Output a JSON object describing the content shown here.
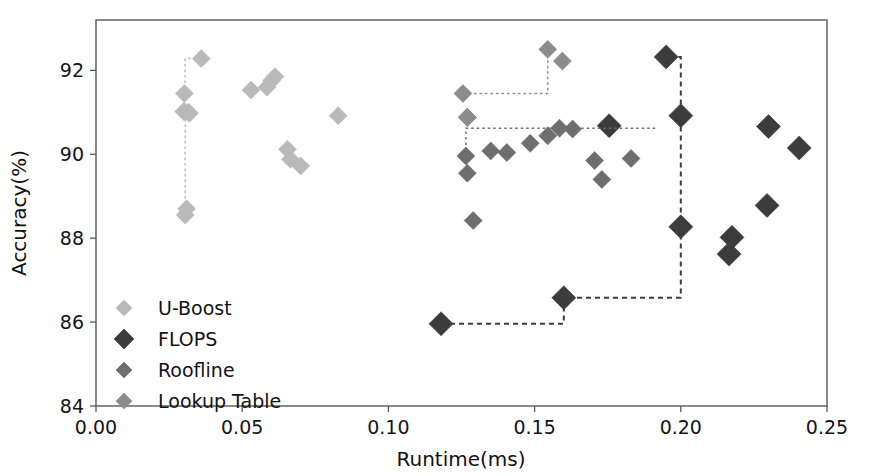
{
  "figure": {
    "background": "#ffffff",
    "frame_color": "#555b5e"
  },
  "chart_data": {
    "type": "scatter",
    "title": "",
    "xlabel": "Runtime(ms)",
    "ylabel": "Accuracy(%)",
    "xlim": [
      0.0,
      0.25
    ],
    "ylim": [
      84,
      93.2
    ],
    "xticks": [
      0.0,
      0.05,
      0.1,
      0.15,
      0.2,
      0.25
    ],
    "xticklabels": [
      "0.00",
      "0.05",
      "0.10",
      "0.15",
      "0.20",
      "0.25"
    ],
    "yticks": [
      84,
      86,
      88,
      90,
      92
    ],
    "yticklabels": [
      "84",
      "86",
      "88",
      "90",
      "92"
    ],
    "grid": false,
    "legend_position": "lower left",
    "marker": "diamond",
    "series": [
      {
        "name": "U-Boost",
        "color": "#b9b9b9",
        "marker_size": 9,
        "points": [
          {
            "x": 0.0305,
            "y": 88.55
          },
          {
            "x": 0.031,
            "y": 88.7
          },
          {
            "x": 0.03,
            "y": 91.02
          },
          {
            "x": 0.0315,
            "y": 91.0
          },
          {
            "x": 0.032,
            "y": 90.98
          },
          {
            "x": 0.0302,
            "y": 91.45
          },
          {
            "x": 0.036,
            "y": 92.28
          },
          {
            "x": 0.053,
            "y": 91.53
          },
          {
            "x": 0.0585,
            "y": 91.6
          },
          {
            "x": 0.06,
            "y": 91.75
          },
          {
            "x": 0.0612,
            "y": 91.85
          },
          {
            "x": 0.0655,
            "y": 90.12
          },
          {
            "x": 0.0665,
            "y": 89.88
          },
          {
            "x": 0.07,
            "y": 89.72
          },
          {
            "x": 0.0828,
            "y": 90.92
          }
        ],
        "pareto_step": [
          {
            "x": 0.0305,
            "y": 88.55
          },
          {
            "x": 0.0305,
            "y": 92.28
          },
          {
            "x": 0.036,
            "y": 92.28
          }
        ]
      },
      {
        "name": "FLOPS",
        "color": "#3c3c3c",
        "marker_size": 12,
        "points": [
          {
            "x": 0.118,
            "y": 85.96
          },
          {
            "x": 0.16,
            "y": 86.58
          },
          {
            "x": 0.2,
            "y": 88.27
          },
          {
            "x": 0.2,
            "y": 90.92
          },
          {
            "x": 0.195,
            "y": 92.32
          },
          {
            "x": 0.1755,
            "y": 90.68
          },
          {
            "x": 0.23,
            "y": 90.66
          },
          {
            "x": 0.2405,
            "y": 90.15
          },
          {
            "x": 0.2295,
            "y": 88.78
          },
          {
            "x": 0.2175,
            "y": 88.02
          },
          {
            "x": 0.2165,
            "y": 87.62
          }
        ],
        "pareto_step": [
          {
            "x": 0.118,
            "y": 85.96
          },
          {
            "x": 0.16,
            "y": 85.96
          },
          {
            "x": 0.16,
            "y": 86.58
          },
          {
            "x": 0.2,
            "y": 86.58
          },
          {
            "x": 0.2,
            "y": 92.32
          },
          {
            "x": 0.195,
            "y": 92.32
          }
        ]
      },
      {
        "name": "Roofline",
        "color": "#6e6e6e",
        "marker_size": 9,
        "points": [
          {
            "x": 0.1265,
            "y": 89.96
          },
          {
            "x": 0.127,
            "y": 89.55
          },
          {
            "x": 0.129,
            "y": 88.42
          },
          {
            "x": 0.135,
            "y": 90.08
          },
          {
            "x": 0.1405,
            "y": 90.04
          },
          {
            "x": 0.1485,
            "y": 90.26
          },
          {
            "x": 0.1545,
            "y": 90.44
          },
          {
            "x": 0.1585,
            "y": 90.62
          },
          {
            "x": 0.163,
            "y": 90.6
          },
          {
            "x": 0.1705,
            "y": 89.85
          },
          {
            "x": 0.173,
            "y": 89.4
          },
          {
            "x": 0.183,
            "y": 89.9
          },
          {
            "x": 0.127,
            "y": 90.88
          }
        ],
        "pareto_step": [
          {
            "x": 0.1265,
            "y": 89.96
          },
          {
            "x": 0.1265,
            "y": 90.62
          },
          {
            "x": 0.1585,
            "y": 90.62
          },
          {
            "x": 0.1585,
            "y": 90.62
          },
          {
            "x": 0.192,
            "y": 90.62
          },
          {
            "x": 0.192,
            "y": 90.62
          }
        ]
      },
      {
        "name": "Lookup Table",
        "color": "#8c8c8c",
        "marker_size": 9,
        "points": [
          {
            "x": 0.1255,
            "y": 91.45
          },
          {
            "x": 0.1545,
            "y": 92.5
          },
          {
            "x": 0.1595,
            "y": 92.22
          },
          {
            "x": 0.127,
            "y": 90.88
          }
        ],
        "pareto_step": [
          {
            "x": 0.1255,
            "y": 91.45
          },
          {
            "x": 0.1545,
            "y": 91.45
          },
          {
            "x": 0.1545,
            "y": 92.5
          }
        ]
      }
    ]
  },
  "legend": {
    "entries": [
      {
        "label": "U-Boost",
        "color": "#b9b9b9"
      },
      {
        "label": "FLOPS",
        "color": "#3c3c3c"
      },
      {
        "label": "Roofline",
        "color": "#6e6e6e"
      },
      {
        "label": "Lookup Table",
        "color": "#8c8c8c"
      }
    ]
  }
}
